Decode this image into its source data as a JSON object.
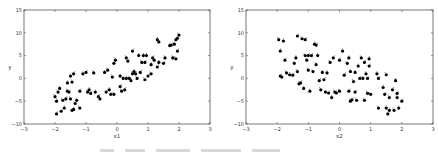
{
  "chart_data": [
    {
      "type": "scatter",
      "title": "",
      "xlabel": "x1",
      "ylabel": "y",
      "xlim": [
        -3,
        3
      ],
      "ylim": [
        -10,
        15
      ],
      "xticks": [
        -3,
        -2,
        -1,
        0,
        1,
        2,
        3
      ],
      "yticks": [
        -10,
        -5,
        0,
        5,
        10,
        15
      ],
      "grid": false,
      "legend": null,
      "marker_color": "#000000",
      "points": [
        [
          -2.0,
          -4.0
        ],
        [
          -1.95,
          -5.0
        ],
        [
          -1.95,
          -7.8
        ],
        [
          -1.9,
          -3.0
        ],
        [
          -1.85,
          -2.2
        ],
        [
          -1.8,
          -7.2
        ],
        [
          -1.75,
          -4.8
        ],
        [
          -1.7,
          -6.5
        ],
        [
          -1.65,
          -4.5
        ],
        [
          -1.6,
          -2.8
        ],
        [
          -1.6,
          -1.0
        ],
        [
          -1.55,
          -3.0
        ],
        [
          -1.5,
          -4.5
        ],
        [
          -1.5,
          0.5
        ],
        [
          -1.45,
          -7.0
        ],
        [
          -1.45,
          -0.8
        ],
        [
          -1.4,
          -6.8
        ],
        [
          -1.4,
          1.0
        ],
        [
          -1.35,
          -5.5
        ],
        [
          -1.3,
          -4.8
        ],
        [
          -1.2,
          -2.8
        ],
        [
          -1.2,
          -6.5
        ],
        [
          -1.1,
          1.0
        ],
        [
          -1.0,
          1.3
        ],
        [
          -0.95,
          -3.0
        ],
        [
          -0.9,
          -2.5
        ],
        [
          -0.85,
          -3.3
        ],
        [
          -0.75,
          1.2
        ],
        [
          -0.7,
          -3.0
        ],
        [
          -0.6,
          -4.0
        ],
        [
          -0.55,
          -4.5
        ],
        [
          -0.4,
          1.3
        ],
        [
          -0.35,
          -3.0
        ],
        [
          -0.3,
          1.8
        ],
        [
          -0.25,
          -2.5
        ],
        [
          -0.2,
          -3.5
        ],
        [
          -0.15,
          0.3
        ],
        [
          -0.1,
          -3.5
        ],
        [
          -0.1,
          3.3
        ],
        [
          -0.05,
          4.0
        ],
        [
          0.1,
          0.5
        ],
        [
          0.1,
          -1.8
        ],
        [
          0.15,
          -2.8
        ],
        [
          0.2,
          0.0
        ],
        [
          0.25,
          -2.5
        ],
        [
          0.3,
          4.5
        ],
        [
          0.3,
          0.0
        ],
        [
          0.35,
          3.8
        ],
        [
          0.4,
          0.0
        ],
        [
          0.45,
          -0.5
        ],
        [
          0.5,
          6.0
        ],
        [
          0.5,
          1.0
        ],
        [
          0.55,
          1.5
        ],
        [
          0.6,
          1.0
        ],
        [
          0.65,
          0.0
        ],
        [
          0.7,
          5.0
        ],
        [
          0.75,
          1.3
        ],
        [
          0.8,
          3.5
        ],
        [
          0.85,
          5.0
        ],
        [
          0.9,
          3.5
        ],
        [
          0.9,
          -0.3
        ],
        [
          0.95,
          5.0
        ],
        [
          1.0,
          0.5
        ],
        [
          1.1,
          1.0
        ],
        [
          1.1,
          3.0
        ],
        [
          1.15,
          4.5
        ],
        [
          1.2,
          4.0
        ],
        [
          1.3,
          8.5
        ],
        [
          1.3,
          2.5
        ],
        [
          1.35,
          8.0
        ],
        [
          1.35,
          3.5
        ],
        [
          1.5,
          3.3
        ],
        [
          1.55,
          4.5
        ],
        [
          1.7,
          7.2
        ],
        [
          1.75,
          7.3
        ],
        [
          1.8,
          4.5
        ],
        [
          1.85,
          7.5
        ],
        [
          1.9,
          8.5
        ],
        [
          1.9,
          4.3
        ],
        [
          1.95,
          8.8
        ],
        [
          1.95,
          6.0
        ],
        [
          2.0,
          9.5
        ]
      ]
    },
    {
      "type": "scatter",
      "title": "",
      "xlabel": "x2",
      "ylabel": "y",
      "xlim": [
        -3,
        3
      ],
      "ylim": [
        -10,
        15
      ],
      "xticks": [
        -3,
        -2,
        -1,
        0,
        1,
        2,
        3
      ],
      "yticks": [
        -10,
        -5,
        0,
        5,
        10,
        15
      ],
      "grid": false,
      "legend": null,
      "marker_color": "#000000",
      "points": [
        [
          -1.95,
          8.5
        ],
        [
          -1.9,
          6.0
        ],
        [
          -1.9,
          0.5
        ],
        [
          -1.85,
          0.3
        ],
        [
          -1.8,
          8.2
        ],
        [
          -1.75,
          4.0
        ],
        [
          -1.7,
          1.2
        ],
        [
          -1.6,
          0.8
        ],
        [
          -1.5,
          0.7
        ],
        [
          -1.45,
          3.3
        ],
        [
          -1.4,
          4.5
        ],
        [
          -1.35,
          9.3
        ],
        [
          -1.35,
          1.5
        ],
        [
          -1.3,
          -1.2
        ],
        [
          -1.25,
          -1.0
        ],
        [
          -1.2,
          8.7
        ],
        [
          -1.15,
          -2.2
        ],
        [
          -1.1,
          8.5
        ],
        [
          -1.1,
          5.0
        ],
        [
          -1.05,
          4.0
        ],
        [
          -1.0,
          5.0
        ],
        [
          -1.0,
          1.8
        ],
        [
          -0.95,
          -2.8
        ],
        [
          -0.9,
          5.0
        ],
        [
          -0.85,
          1.5
        ],
        [
          -0.8,
          7.5
        ],
        [
          -0.75,
          7.3
        ],
        [
          -0.75,
          3.0
        ],
        [
          -0.7,
          5.0
        ],
        [
          -0.65,
          -0.5
        ],
        [
          -0.6,
          -2.5
        ],
        [
          -0.55,
          1.3
        ],
        [
          -0.5,
          -0.3
        ],
        [
          -0.45,
          -3.0
        ],
        [
          -0.4,
          1.2
        ],
        [
          -0.35,
          -3.2
        ],
        [
          -0.3,
          3.5
        ],
        [
          -0.25,
          -4.2
        ],
        [
          -0.2,
          4.5
        ],
        [
          -0.15,
          -3.0
        ],
        [
          -0.1,
          -3.2
        ],
        [
          0.0,
          4.0
        ],
        [
          0.0,
          -2.8
        ],
        [
          0.1,
          6.0
        ],
        [
          0.15,
          0.7
        ],
        [
          0.25,
          3.3
        ],
        [
          0.3,
          4.5
        ],
        [
          0.3,
          -2.8
        ],
        [
          0.35,
          -5.0
        ],
        [
          0.35,
          1.5
        ],
        [
          0.4,
          -4.7
        ],
        [
          0.45,
          -0.7
        ],
        [
          0.5,
          1.3
        ],
        [
          0.5,
          -3.0
        ],
        [
          0.55,
          -4.8
        ],
        [
          0.6,
          2.7
        ],
        [
          0.65,
          0.0
        ],
        [
          0.7,
          4.5
        ],
        [
          0.75,
          0.0
        ],
        [
          0.8,
          3.5
        ],
        [
          0.8,
          -4.8
        ],
        [
          0.85,
          1.0
        ],
        [
          0.9,
          0.0
        ],
        [
          0.9,
          -3.3
        ],
        [
          0.95,
          4.3
        ],
        [
          0.95,
          2.7
        ],
        [
          1.0,
          -3.5
        ],
        [
          1.2,
          1.0
        ],
        [
          1.25,
          0.0
        ],
        [
          1.25,
          -6.5
        ],
        [
          1.4,
          -2.0
        ],
        [
          1.45,
          -3.5
        ],
        [
          1.5,
          0.8
        ],
        [
          1.5,
          -6.5
        ],
        [
          1.55,
          -7.8
        ],
        [
          1.6,
          -4.2
        ],
        [
          1.6,
          -7.0
        ],
        [
          1.7,
          -2.5
        ],
        [
          1.75,
          -7.0
        ],
        [
          1.8,
          -0.5
        ],
        [
          1.85,
          -3.3
        ],
        [
          1.85,
          -4.2
        ],
        [
          1.9,
          -6.5
        ],
        [
          2.0,
          -5.0
        ]
      ]
    }
  ],
  "panels": [
    {
      "frame": {
        "left": 24,
        "top": 10,
        "right": 210,
        "bottom": 124
      }
    },
    {
      "frame": {
        "left": 246,
        "top": 10,
        "right": 433,
        "bottom": 124
      }
    }
  ],
  "colors": {
    "axes": "#555555",
    "text": "#333333",
    "marker": "#000000",
    "caption": "#d8d8d8"
  }
}
